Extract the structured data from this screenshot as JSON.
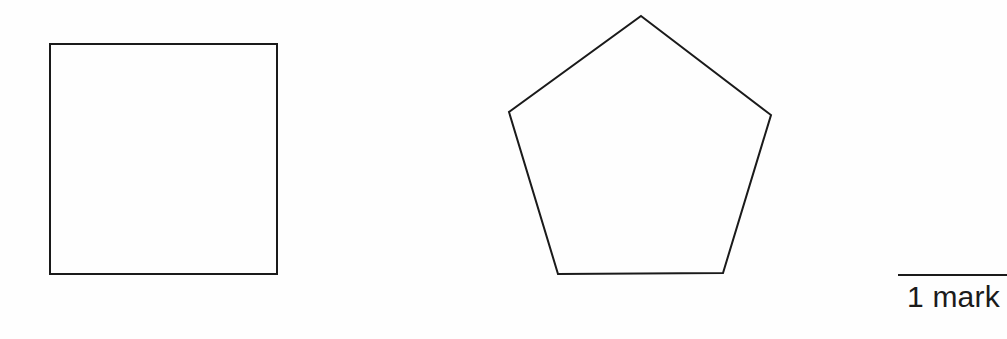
{
  "page": {
    "width": 1007,
    "height": 339,
    "background_color": "#ffffff",
    "ink_color": "#1a1a1a"
  },
  "figure": {
    "stroke_color": "#1a1a1a",
    "stroke_width": 2,
    "fill": "none",
    "shapes": [
      {
        "name": "square",
        "type": "polygon",
        "sides": 4,
        "label": "",
        "bounds": {
          "x": 50,
          "y": 44,
          "width": 227,
          "height": 230
        },
        "points": "50,44 277,44 277,274 50,274"
      },
      {
        "name": "pentagon",
        "type": "polygon",
        "sides": 5,
        "label": "",
        "bounds": {
          "x": 509,
          "y": 16,
          "width": 262,
          "height": 258
        },
        "points": "641,16 771,115 723,273 558,274 509,112"
      }
    ]
  },
  "marks": {
    "label": "1 mark",
    "value": 1,
    "unit": "mark",
    "rule_color": "#1a1a1a"
  }
}
